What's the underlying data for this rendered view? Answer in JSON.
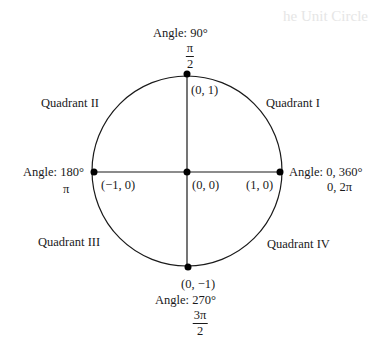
{
  "background_title_fragment": "he Unit Circle",
  "diagram": {
    "type": "unit-circle",
    "center": {
      "x": 187,
      "y": 171
    },
    "radius": 95,
    "line_color": "#1a1a1a",
    "dot_color": "#000000"
  },
  "quadrants": {
    "q1": "Quadrant I",
    "q2": "Quadrant II",
    "q3": "Quadrant III",
    "q4": "Quadrant IV"
  },
  "points": {
    "top": {
      "coord": "(0, 1)",
      "angle_label": "Angle: 90°",
      "radian_num": "π",
      "radian_den": "2"
    },
    "left": {
      "coord": "(−1, 0)",
      "angle_label": "Angle: 180°",
      "radian": "π"
    },
    "origin": {
      "coord": "(0, 0)"
    },
    "right": {
      "coord": "(1, 0)",
      "angle_label": "Angle: 0, 360°",
      "radian": "0, 2π"
    },
    "bottom": {
      "coord": "(0, −1)",
      "angle_label": "Angle: 270°",
      "radian_num": "3π",
      "radian_den": "2"
    }
  }
}
